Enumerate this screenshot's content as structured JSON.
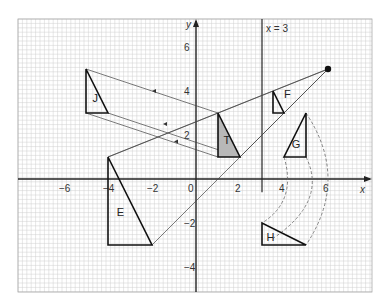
{
  "diagram": {
    "axes": {
      "x_label": "x",
      "y_label": "y",
      "origin_label": "0",
      "x_ticks": [
        {
          "v": -6,
          "label": "−6"
        },
        {
          "v": -4,
          "label": "−4"
        },
        {
          "v": -2,
          "label": "−2"
        },
        {
          "v": 2,
          "label": "2"
        },
        {
          "v": 4,
          "label": "4"
        },
        {
          "v": 6,
          "label": "6"
        }
      ],
      "y_ticks": [
        {
          "v": 6,
          "label": "6"
        },
        {
          "v": 4,
          "label": "4"
        },
        {
          "v": 2,
          "label": "2"
        },
        {
          "v": -2,
          "label": "−2"
        },
        {
          "v": -4,
          "label": "−4"
        }
      ],
      "x_range": [
        -8,
        8
      ],
      "y_range": [
        -5,
        7
      ]
    },
    "mirror_line": {
      "label": "x = 3",
      "x": 3
    },
    "center_point": {
      "x": 6,
      "y": 5
    },
    "shapes": [
      {
        "name": "J",
        "points": [
          [
            -5,
            5
          ],
          [
            -5,
            3
          ],
          [
            -4,
            3
          ]
        ],
        "label_pos": [
          -4.7,
          3.5
        ],
        "shaded": false
      },
      {
        "name": "T",
        "points": [
          [
            1,
            3
          ],
          [
            1,
            1
          ],
          [
            2,
            1
          ]
        ],
        "label_pos": [
          1.25,
          1.6
        ],
        "shaded": true
      },
      {
        "name": "F",
        "points": [
          [
            3.5,
            4
          ],
          [
            3.5,
            3
          ],
          [
            4,
            3
          ]
        ],
        "label_pos": [
          4,
          3.7
        ],
        "shaded": false
      },
      {
        "name": "G",
        "points": [
          [
            5,
            3
          ],
          [
            4,
            1
          ],
          [
            5,
            1
          ]
        ],
        "label_pos": [
          4.35,
          1.4
        ],
        "shaded": false
      },
      {
        "name": "E",
        "points": [
          [
            -4,
            1
          ],
          [
            -4,
            -3
          ],
          [
            -2,
            -3
          ]
        ],
        "label_pos": [
          -3.6,
          -1.7
        ],
        "shaded": false
      },
      {
        "name": "H",
        "points": [
          [
            3,
            -2
          ],
          [
            3,
            -3
          ],
          [
            5,
            -3
          ]
        ],
        "label_pos": [
          3.2,
          -2.8
        ],
        "shaded": false
      }
    ]
  }
}
